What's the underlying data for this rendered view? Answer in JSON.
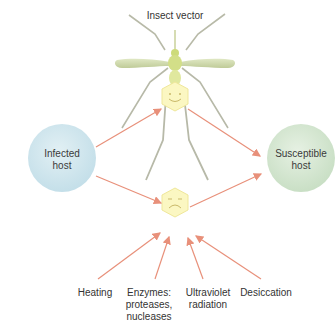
{
  "title": "Insect vector",
  "nodes": {
    "infected_host": {
      "line1": "Infected",
      "line2": "host",
      "color": "#cfe6ee"
    },
    "susceptible_host": {
      "line1": "Susceptible",
      "line2": "host",
      "color": "#d6e8d4"
    },
    "vector": {
      "label": "Insect vector",
      "color": "#d9e2b6"
    },
    "happy_virus": {
      "icon": "happy-hexagon",
      "color": "#fbf6c0"
    },
    "sad_virus": {
      "icon": "sad-hexagon",
      "color": "#fbf6c0"
    }
  },
  "factors": [
    {
      "line1": "Heating",
      "line2": "",
      "line3": ""
    },
    {
      "line1": "Enzymes:",
      "line2": "proteases,",
      "line3": "nucleases"
    },
    {
      "line1": "Ultraviolet",
      "line2": "radiation",
      "line3": ""
    },
    {
      "line1": "Desiccation",
      "line2": "",
      "line3": ""
    }
  ],
  "colors": {
    "arrow": "#e8907a",
    "leg": "#b7b9a8",
    "wing": "#c9d5a6"
  }
}
